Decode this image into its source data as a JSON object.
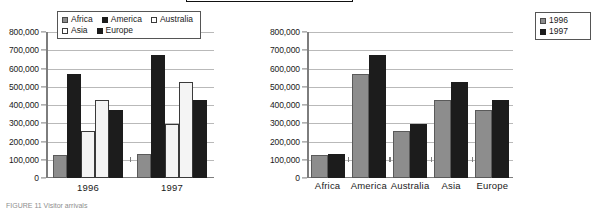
{
  "top_bar": {
    "name": "cropped-toolbar-strip"
  },
  "caption": "FIGURE 11  Visitor arrivals",
  "axis": {
    "ticks": [
      "800,000",
      "700,000",
      "600,000",
      "500,000",
      "400,000",
      "300,000",
      "200,000",
      "100,000",
      "0"
    ],
    "ymin": 0,
    "ymax": 800000,
    "step": 100000
  },
  "chart_data": [
    {
      "type": "bar",
      "title": "",
      "xlabel": "",
      "ylabel": "",
      "ylim": [
        0,
        800000
      ],
      "grid": true,
      "legend_position": "top",
      "categories": [
        "1996",
        "1997"
      ],
      "series": [
        {
          "name": "Africa",
          "color": "#8d8d8d",
          "values": [
            125000,
            133000
          ]
        },
        {
          "name": "America",
          "color": "#1c1c1c",
          "values": [
            570000,
            672000
          ]
        },
        {
          "name": "Australia",
          "color": "#ffffff",
          "values": [
            260000,
            298000
          ]
        },
        {
          "name": "Asia",
          "color": "#f4f4f4",
          "values": [
            430000,
            528000
          ]
        },
        {
          "name": "Europe",
          "color": "#1c1c1c",
          "values": [
            370000,
            430000
          ]
        }
      ]
    },
    {
      "type": "bar",
      "title": "",
      "xlabel": "",
      "ylabel": "",
      "ylim": [
        0,
        800000
      ],
      "grid": true,
      "legend_position": "top-left",
      "categories": [
        "Africa",
        "America",
        "Australia",
        "Asia",
        "Europe"
      ],
      "series": [
        {
          "name": "1996",
          "color": "#8d8d8d",
          "values": [
            125000,
            570000,
            260000,
            430000,
            370000
          ]
        },
        {
          "name": "1997",
          "color": "#1c1c1c",
          "values": [
            133000,
            672000,
            298000,
            528000,
            430000
          ]
        }
      ]
    }
  ]
}
